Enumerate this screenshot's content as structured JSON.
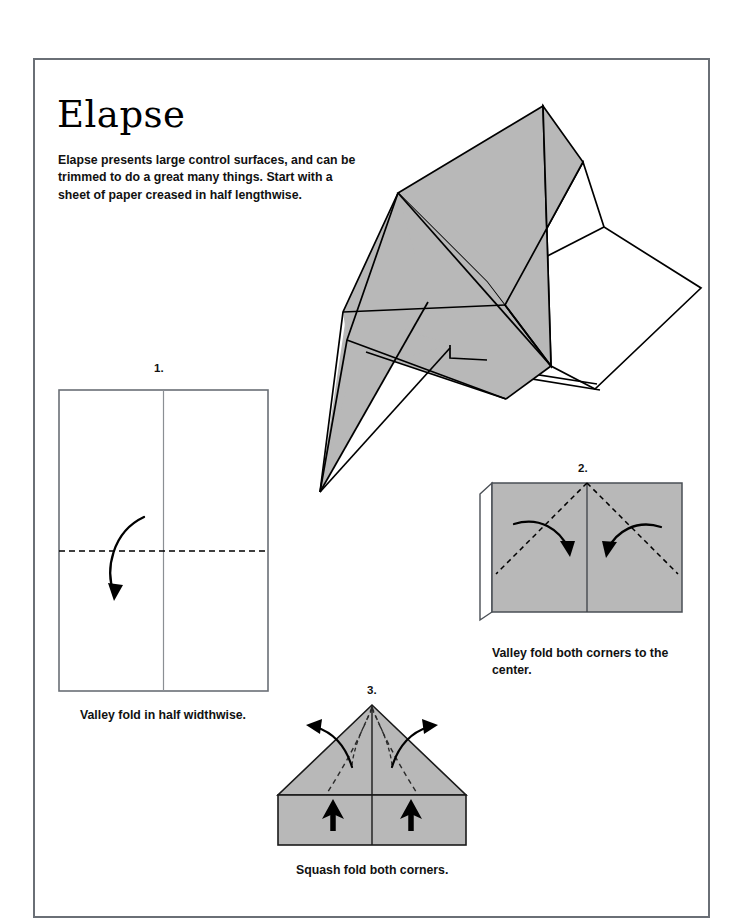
{
  "document": {
    "title": "Elapse",
    "intro": "Elapse presents large control surfaces, and can be trimmed to do a great many things.  Start with a sheet of paper creased in half lengthwise."
  },
  "colors": {
    "paper_gray": "#b8b8b8",
    "paper_white": "#ffffff",
    "line": "#000000",
    "frame": "#6a6f76"
  },
  "hero": {
    "name": "finished-paper-airplane-illustration",
    "description": "Three-quarter perspective drawing of the completed Elapse paper airplane with one shaded wing and one white wing"
  },
  "steps": [
    {
      "number": "1.",
      "caption": "Valley fold in half widthwise.",
      "shape": "portrait-rectangle",
      "fill": "white",
      "marks": [
        "vertical-center-crease",
        "horizontal-dashed-fold-line",
        "curved-valley-fold-arrow"
      ]
    },
    {
      "number": "2.",
      "caption": "Valley fold both corners to the center.",
      "shape": "square-with-back-layer-sliver",
      "fill": "gray",
      "marks": [
        "vertical-center-crease",
        "two-dashed-diagonal-fold-lines",
        "two-curved-valley-fold-arrows"
      ]
    },
    {
      "number": "3.",
      "caption": "Squash fold both corners.",
      "shape": "triangle-over-rectangle",
      "fill": "gray",
      "marks": [
        "vertical-center-crease",
        "two-dashed-curved-fold-lines",
        "two-outward-curved-arrows",
        "two-solid-push-arrows"
      ]
    }
  ]
}
